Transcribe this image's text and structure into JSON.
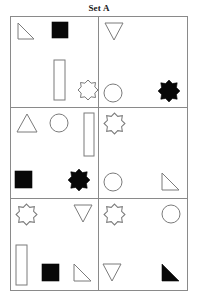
{
  "title": "Set A",
  "colors": {
    "outline": "#7b7b7b",
    "fill": "#080808",
    "grid_line": "#8a8a8a",
    "background": "#ffffff"
  },
  "grid": {
    "rows": 3,
    "columns": 2,
    "cell_count": 6
  },
  "cells": [
    {
      "id": "cell-1",
      "position": "top-left",
      "shapes": [
        {
          "name": "right-triangle",
          "style": "outline",
          "size": "small",
          "x": 6,
          "y": 5
        },
        {
          "name": "square",
          "style": "filled",
          "size": "small",
          "x": 40,
          "y": 4
        },
        {
          "name": "rectangle-vertical",
          "style": "outline",
          "size": "medium",
          "x": 42,
          "y": 42
        },
        {
          "name": "eight-point-star",
          "style": "outline",
          "size": "small",
          "x": 66,
          "y": 62
        }
      ]
    },
    {
      "id": "cell-2",
      "position": "top-right",
      "shapes": [
        {
          "name": "down-triangle",
          "style": "outline",
          "size": "small",
          "x": 5,
          "y": 5
        },
        {
          "name": "circle",
          "style": "outline",
          "size": "small",
          "x": 4,
          "y": 66
        },
        {
          "name": "eight-point-star",
          "style": "filled",
          "size": "small",
          "x": 58,
          "y": 62
        }
      ]
    },
    {
      "id": "cell-3",
      "position": "middle-left",
      "shapes": [
        {
          "name": "up-triangle",
          "style": "outline",
          "size": "small",
          "x": 5,
          "y": 5
        },
        {
          "name": "circle",
          "style": "outline",
          "size": "small",
          "x": 38,
          "y": 5
        },
        {
          "name": "rectangle-vertical",
          "style": "outline",
          "size": "medium",
          "x": 72,
          "y": 4
        },
        {
          "name": "square",
          "style": "filled",
          "size": "small",
          "x": 3,
          "y": 62
        },
        {
          "name": "eight-point-star",
          "style": "filled",
          "size": "small",
          "x": 56,
          "y": 60
        }
      ]
    },
    {
      "id": "cell-4",
      "position": "middle-right",
      "shapes": [
        {
          "name": "eight-point-star",
          "style": "outline",
          "size": "small",
          "x": 4,
          "y": 4
        },
        {
          "name": "circle",
          "style": "outline",
          "size": "small",
          "x": 4,
          "y": 64
        },
        {
          "name": "right-triangle",
          "style": "outline",
          "size": "small",
          "x": 62,
          "y": 64
        }
      ]
    },
    {
      "id": "cell-5",
      "position": "bottom-left",
      "shapes": [
        {
          "name": "eight-point-star",
          "style": "outline",
          "size": "small",
          "x": 4,
          "y": 4
        },
        {
          "name": "down-triangle",
          "style": "outline",
          "size": "small",
          "x": 62,
          "y": 5
        },
        {
          "name": "rectangle-vertical",
          "style": "outline",
          "size": "medium",
          "x": 4,
          "y": 45
        },
        {
          "name": "square",
          "style": "filled",
          "size": "small",
          "x": 30,
          "y": 64
        },
        {
          "name": "right-triangle",
          "style": "outline",
          "size": "small",
          "x": 62,
          "y": 64
        }
      ]
    },
    {
      "id": "cell-6",
      "position": "bottom-right",
      "shapes": [
        {
          "name": "eight-point-star",
          "style": "outline",
          "size": "small",
          "x": 4,
          "y": 4
        },
        {
          "name": "circle",
          "style": "outline",
          "size": "small",
          "x": 62,
          "y": 5
        },
        {
          "name": "down-triangle",
          "style": "outline",
          "size": "small",
          "x": 3,
          "y": 64
        },
        {
          "name": "right-triangle",
          "style": "filled",
          "size": "small",
          "x": 62,
          "y": 64
        }
      ]
    }
  ]
}
